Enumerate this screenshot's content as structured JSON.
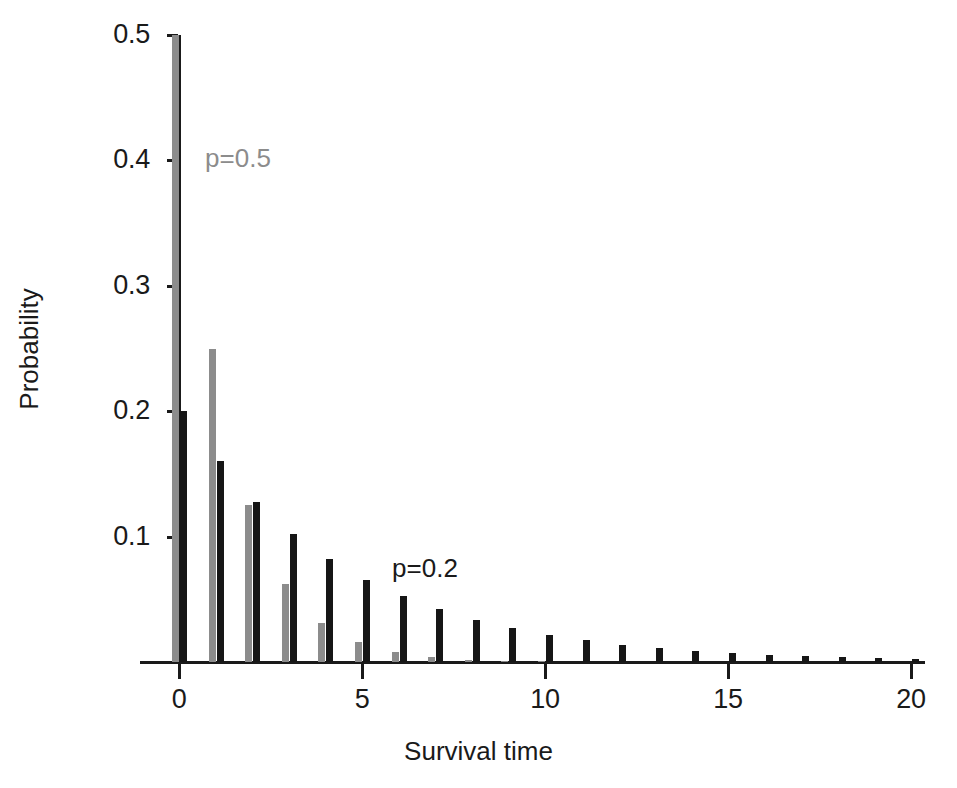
{
  "chart_data": {
    "type": "bar",
    "title": "",
    "subtitle": "",
    "xlabel": "Survival time",
    "ylabel": "Probability",
    "xlim": [
      -0.6,
      20.6
    ],
    "ylim": [
      0,
      0.5
    ],
    "grid": false,
    "legend_position": "inline-annotations",
    "x": [
      0,
      1,
      2,
      3,
      4,
      5,
      6,
      7,
      8,
      9,
      10,
      11,
      12,
      13,
      14,
      15,
      16,
      17,
      18,
      19,
      20
    ],
    "xtick_values": [
      0,
      5,
      10,
      15,
      20
    ],
    "xtick_labels": [
      "0",
      "5",
      "10",
      "15",
      "20"
    ],
    "ytick_values": [
      0.1,
      0.2,
      0.3,
      0.4,
      0.5
    ],
    "ytick_labels": [
      "0.1",
      "0.2",
      "0.3",
      "0.4",
      "0.5"
    ],
    "series": [
      {
        "name": "p=0.5",
        "color": "#8c8c8c",
        "offset": -1,
        "values": [
          0.5,
          0.25,
          0.125,
          0.0625,
          0.03125,
          0.015625,
          0.0078125,
          0.00390625,
          0.001953125,
          0.0009765625,
          0.00048828125,
          0.000244140625,
          0.0001220703125,
          6.103515625e-05,
          3.0517578125e-05,
          1.52587890625e-05,
          7.62939453125e-06,
          3.814697265625e-06,
          1.9073486328125e-06,
          9.5367431640625e-07,
          4.76837158203125e-07
        ]
      },
      {
        "name": "p=0.2",
        "color": "#161616",
        "offset": 1,
        "values": [
          0.2,
          0.16,
          0.128,
          0.1024,
          0.08192,
          0.065536,
          0.0524288,
          0.04194304,
          0.033554432,
          0.0268435456,
          0.02147483648,
          0.017179869184,
          0.0137438953472,
          0.01099511627776,
          0.008796093022208,
          0.0070368744177664,
          0.00562949953421312,
          0.004503599627370496,
          0.0036028797018963967,
          0.0028823037615171173,
          0.002305843009213694
        ]
      }
    ],
    "annotations": [
      {
        "text": "p=0.5",
        "x_px": 238,
        "y_px": 158,
        "color": "#8c8c8c"
      },
      {
        "text": "p=0.2",
        "x_px": 425,
        "y_px": 568,
        "color": "#1a1a1a"
      }
    ]
  }
}
